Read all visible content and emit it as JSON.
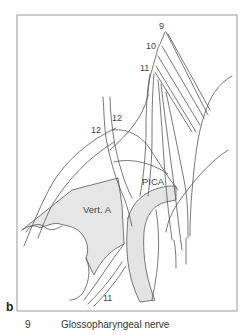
{
  "figure": {
    "panel_letter": "b",
    "labels": {
      "nerve_9": "9",
      "nerve_10": "10",
      "nerve_11_top": "11",
      "nerve_11_bottom": "11",
      "nerve_12_a": "12",
      "nerve_12_b": "12",
      "vertebral_artery": "Vert. A",
      "pica": "PICA"
    },
    "colors": {
      "frame": "#9a9a9a",
      "line": "#555555",
      "vessel_fill": "#e4e4e4",
      "background": "#ffffff"
    }
  },
  "legend": {
    "items": [
      {
        "number": "9",
        "description": "Glossopharyngeal nerve"
      }
    ]
  }
}
